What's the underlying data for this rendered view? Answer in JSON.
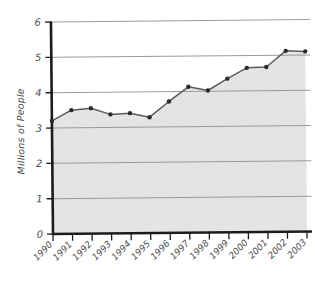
{
  "chart_data": {
    "type": "area",
    "title": "",
    "subtitle": "",
    "xlabel": "",
    "ylabel": "Millions of People",
    "categories": [
      "1990",
      "1991",
      "1992",
      "1993",
      "1994",
      "1995",
      "1996",
      "1997",
      "1998",
      "1999",
      "2000",
      "2001",
      "2002",
      "2003"
    ],
    "values": [
      3.2,
      3.5,
      3.55,
      3.37,
      3.4,
      3.28,
      3.72,
      4.13,
      4.02,
      4.35,
      4.65,
      4.67,
      5.12,
      5.1
    ],
    "series": [
      {
        "name": "Millions of People",
        "values": [
          3.2,
          3.5,
          3.55,
          3.37,
          3.4,
          3.28,
          3.72,
          4.13,
          4.02,
          4.35,
          4.65,
          4.67,
          5.12,
          5.1
        ]
      }
    ],
    "ylim": [
      0,
      6
    ],
    "yticks": [
      0,
      1,
      2,
      3,
      4,
      5,
      6
    ],
    "ytick_labels": [
      "0",
      "1",
      "2",
      "3",
      "4",
      "5",
      "6"
    ],
    "xtick_labels": [
      "1990",
      "1991",
      "1992",
      "1993",
      "1994",
      "1995",
      "1996",
      "1997",
      "1998",
      "1999",
      "2000",
      "2001",
      "2002",
      "2003"
    ],
    "grid": true,
    "grid_axis": "y",
    "legend": false,
    "legend_position": "none",
    "marker": "dot",
    "xlabel_rotation": -45,
    "annotations": []
  },
  "style": {
    "background_color": "#ffffff",
    "area_fill_color": "#e4e4e4",
    "line_color": "#5b5b5b",
    "marker_color": "#2b2b2b",
    "gridline_color": "#9a9a9a",
    "axis_color": "#1c1c1c",
    "tick_label_color": "#4d4d4d",
    "axis_title_color": "#4a4a4a"
  },
  "axis": {
    "y_title": "Millions of People"
  }
}
